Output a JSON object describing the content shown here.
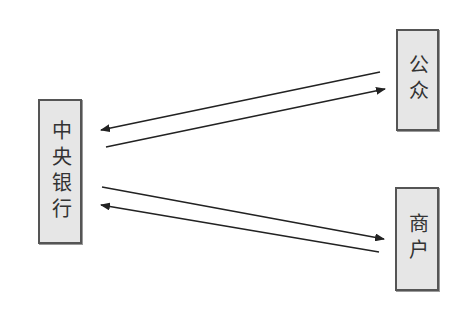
{
  "diagram": {
    "nodes": [
      {
        "id": "central-bank",
        "label": "中央银行",
        "x": 38,
        "y": 99,
        "w": 44,
        "h": 145
      },
      {
        "id": "public",
        "label": "公众",
        "x": 396,
        "y": 29,
        "w": 43,
        "h": 102
      },
      {
        "id": "merchant",
        "label": "商户",
        "x": 395,
        "y": 187,
        "w": 44,
        "h": 104
      }
    ],
    "edges": [
      {
        "from": "public",
        "to": "central-bank",
        "x1": 380,
        "y1": 72,
        "x2": 101,
        "y2": 130
      },
      {
        "from": "central-bank",
        "to": "public",
        "x1": 106,
        "y1": 147,
        "x2": 385,
        "y2": 89
      },
      {
        "from": "central-bank",
        "to": "merchant",
        "x1": 102,
        "y1": 187,
        "x2": 384,
        "y2": 239
      },
      {
        "from": "merchant",
        "to": "central-bank",
        "x1": 379,
        "y1": 252,
        "x2": 101,
        "y2": 205
      }
    ],
    "colors": {
      "box_fill": "#e6e6e6",
      "box_border": "#555555",
      "line": "#222222"
    }
  }
}
